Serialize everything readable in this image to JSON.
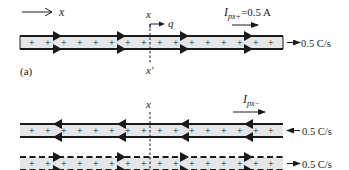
{
  "diagram": {
    "axis_label": "x",
    "section_label_top": "x",
    "section_label_bottom": "x'",
    "charge_label": "q",
    "panel_label": "(a)",
    "current_plus": {
      "symbol": "I",
      "subscript": "px+",
      "equals": "=0.5 A"
    },
    "current_minus": {
      "symbol": "I",
      "subscript": "px−"
    },
    "bands": [
      {
        "id": "band-a",
        "border": "solid",
        "arrow_direction": "right",
        "rate_label": "0.5 C/s",
        "rate_arrow": "out-right",
        "charge_sign": "+",
        "charge_count": 12
      },
      {
        "id": "band-b1",
        "border": "solid",
        "arrow_direction": "left",
        "rate_label": "0.5 C/s",
        "rate_arrow": "in-left",
        "charge_sign": "+",
        "charge_count": 12
      },
      {
        "id": "band-b2",
        "border": "dashed",
        "arrow_direction": "right",
        "rate_label": "0.5 C/s",
        "rate_arrow": "out-right",
        "charge_sign": "+",
        "charge_count": 12
      }
    ],
    "colors": {
      "band_fill": "#e6e6e6",
      "line": "#1a1a1a",
      "text": "#222222"
    }
  }
}
